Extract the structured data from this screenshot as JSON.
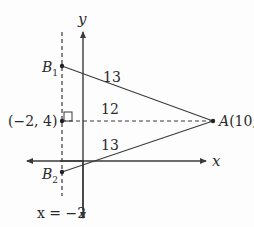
{
  "diagram": {
    "type": "coordinate-geometry",
    "axes": {
      "x_label": "x",
      "y_label": "y"
    },
    "vertical_line": {
      "label": "x = −2",
      "style": "dashed"
    },
    "points": {
      "A": {
        "name": "A",
        "coords": "(10, 4)",
        "label": "A(10, 4)"
      },
      "B1": {
        "name": "B",
        "subscript": "1"
      },
      "B2": {
        "name": "B",
        "subscript": "2"
      },
      "foot": {
        "label": "(−2, 4)"
      }
    },
    "segments": {
      "AB1_length": "13",
      "horizontal_length": "12",
      "AB2_length": "13"
    },
    "right_angle_marker": true,
    "colors": {
      "line": "#3a3a3a",
      "text": "#2a2a2a",
      "background": "#fdfdfd"
    }
  }
}
